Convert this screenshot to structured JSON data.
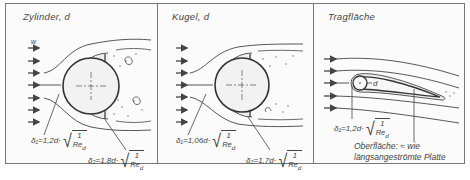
{
  "panels": [
    {
      "id": "zylinder",
      "title": "Zylinder, d",
      "flow_label": "w",
      "formulas": [
        {
          "symbol": "δ₁",
          "coef": "1,2",
          "var": "d",
          "num": "1",
          "den": "Re",
          "den_sub": "d"
        },
        {
          "symbol": "δ₂",
          "coef": "1,8",
          "var": "d",
          "num": "1",
          "den": "Re",
          "den_sub": "d"
        }
      ]
    },
    {
      "id": "kugel",
      "title": "Kugel, d",
      "formulas": [
        {
          "symbol": "δ₁",
          "coef": "1,06",
          "var": "d",
          "num": "1",
          "den": "Re",
          "den_sub": "d"
        },
        {
          "symbol": "δ₂",
          "coef": "1,7",
          "var": "d",
          "num": "1",
          "den": "Re",
          "den_sub": "d"
        }
      ]
    },
    {
      "id": "tragflaeche",
      "title": "Tragfläche",
      "diameter_label": "d",
      "formulas": [
        {
          "symbol": "δ₁",
          "coef": "1,2",
          "var": "d",
          "num": "1",
          "den": "Re",
          "den_sub": "d"
        }
      ],
      "note_line1": "Oberfläche: ≈ wie",
      "note_line2": "längsangeströmte Platte"
    }
  ],
  "colors": {
    "line": "#444444",
    "frame": "#777777",
    "background": "#fbfbfb"
  }
}
